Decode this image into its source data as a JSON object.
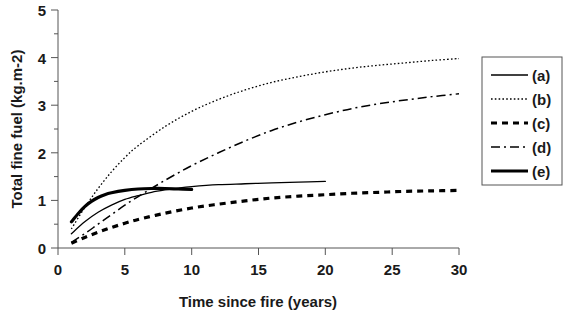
{
  "chart_data": {
    "type": "line",
    "title": "",
    "xlabel": "Time since fire (years)",
    "ylabel": "Total fine fuel (kg.m-2)",
    "xlim": [
      0,
      30
    ],
    "ylim": [
      0,
      5
    ],
    "xticks": [
      "0",
      "5",
      "10",
      "15",
      "20",
      "25",
      "30"
    ],
    "yticks": [
      "0",
      "1",
      "2",
      "3",
      "4",
      "5"
    ],
    "xtick_values": [
      0,
      5,
      10,
      15,
      20,
      25,
      30
    ],
    "ytick_values": [
      0,
      1,
      2,
      3,
      4,
      5
    ],
    "minor_ytick_step": 0.5,
    "grid": false,
    "legend_position": "right-outside",
    "series": [
      {
        "name": "(a)",
        "style": "solid-thin",
        "x": [
          1,
          2,
          3,
          4,
          5,
          6,
          7,
          8,
          9,
          10,
          12,
          14,
          16,
          18,
          20
        ],
        "values": [
          0.3,
          0.55,
          0.75,
          0.9,
          1.02,
          1.1,
          1.17,
          1.22,
          1.26,
          1.29,
          1.33,
          1.35,
          1.37,
          1.385,
          1.4
        ]
      },
      {
        "name": "(b)",
        "style": "dotted",
        "x": [
          1,
          2,
          3,
          4,
          5,
          6,
          8,
          10,
          12,
          14,
          16,
          18,
          20,
          22,
          24,
          26,
          28,
          30
        ],
        "values": [
          0.4,
          0.85,
          1.25,
          1.6,
          1.9,
          2.15,
          2.55,
          2.87,
          3.12,
          3.32,
          3.48,
          3.6,
          3.7,
          3.78,
          3.84,
          3.89,
          3.94,
          3.98
        ]
      },
      {
        "name": "(c)",
        "style": "dashed-thick",
        "x": [
          1,
          2,
          3,
          4,
          5,
          6,
          8,
          10,
          12,
          14,
          16,
          18,
          20,
          22,
          24,
          26,
          28,
          30
        ],
        "values": [
          0.1,
          0.22,
          0.33,
          0.43,
          0.52,
          0.6,
          0.73,
          0.84,
          0.92,
          0.99,
          1.05,
          1.09,
          1.12,
          1.15,
          1.17,
          1.19,
          1.2,
          1.21
        ]
      },
      {
        "name": "(d)",
        "style": "dash-dot",
        "x": [
          1,
          2,
          3,
          4,
          5,
          6,
          8,
          10,
          12,
          14,
          16,
          18,
          20,
          22,
          24,
          26,
          28,
          30
        ],
        "values": [
          0.12,
          0.3,
          0.5,
          0.7,
          0.9,
          1.08,
          1.42,
          1.73,
          2.0,
          2.25,
          2.47,
          2.65,
          2.8,
          2.93,
          3.03,
          3.11,
          3.18,
          3.24
        ]
      },
      {
        "name": "(e)",
        "style": "solid-thick",
        "x": [
          1,
          1.5,
          2,
          2.5,
          3,
          3.5,
          4,
          5,
          6,
          7,
          8,
          9,
          10
        ],
        "values": [
          0.55,
          0.72,
          0.87,
          0.98,
          1.06,
          1.12,
          1.16,
          1.21,
          1.24,
          1.25,
          1.25,
          1.24,
          1.23
        ]
      }
    ],
    "legend_entries": [
      {
        "label": "(a)",
        "style": "solid-thin"
      },
      {
        "label": "(b)",
        "style": "dotted"
      },
      {
        "label": "(c)",
        "style": "dashed-thick"
      },
      {
        "label": "(d)",
        "style": "dash-dot"
      },
      {
        "label": "(e)",
        "style": "solid-thick"
      }
    ],
    "colors": {
      "line": "#000000",
      "axis": "#555555",
      "text": "#1a1a1a",
      "background": "#ffffff"
    }
  }
}
